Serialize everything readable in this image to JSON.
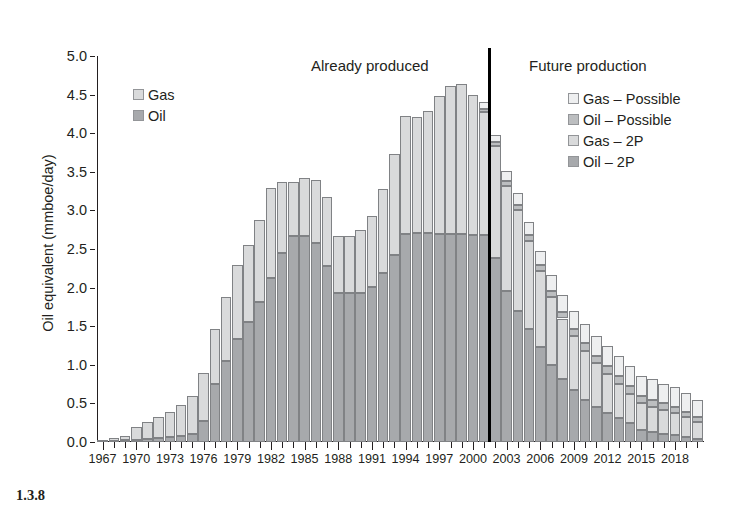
{
  "caption": "1.3.8",
  "headings": {
    "already": "Already produced",
    "future": "Future production"
  },
  "legend_left": [
    {
      "label": "Gas",
      "swatch": "gas",
      "color": "#d9dadb"
    },
    {
      "label": "Oil",
      "swatch": "oil",
      "color": "#a7a9ac"
    }
  ],
  "legend_right": [
    {
      "label": "Gas – Possible",
      "swatch": "gaspos",
      "color": "#eeeff0"
    },
    {
      "label": "Oil – Possible",
      "swatch": "oilpos",
      "color": "#bcbec0"
    },
    {
      "label": "Gas – 2P",
      "swatch": "gas2p",
      "color": "#d9dadb"
    },
    {
      "label": "Oil – 2P",
      "swatch": "oil2p",
      "color": "#a7a9ac"
    }
  ],
  "chart_data": {
    "type": "bar",
    "stacked": true,
    "title": "",
    "xlabel": "",
    "ylabel": "Oil equivalent (mmboe/day)",
    "ylim": [
      0.0,
      5.0
    ],
    "ytick_step": 0.5,
    "ytick_labels": [
      "0.0",
      "0.5",
      "1.0",
      "1.5",
      "2.0",
      "2.5",
      "3.0",
      "3.5",
      "4.0",
      "4.5",
      "5.0"
    ],
    "grid": false,
    "legend_position": "inside-top-left and inside-top-right",
    "xlim": [
      1966,
      2020
    ],
    "xtick_label_step": 3,
    "xtick_labels": [
      "1967",
      "1970",
      "1973",
      "1976",
      "1979",
      "1982",
      "1985",
      "1988",
      "1991",
      "1994",
      "1997",
      "2000",
      "2003",
      "2006",
      "2009",
      "2012",
      "2015",
      "2018"
    ],
    "divider": {
      "between": [
        2001,
        2002
      ],
      "label_left": "Already produced",
      "label_right": "Future production"
    },
    "series_names": [
      "Oil – 2P",
      "Gas – 2P",
      "Oil – Possible",
      "Gas – Possible"
    ],
    "historic_series_names": [
      "Oil",
      "Gas"
    ],
    "years": [
      1967,
      1968,
      1969,
      1970,
      1971,
      1972,
      1973,
      1974,
      1975,
      1976,
      1977,
      1978,
      1979,
      1980,
      1981,
      1982,
      1983,
      1984,
      1985,
      1986,
      1987,
      1988,
      1989,
      1990,
      1991,
      1992,
      1993,
      1994,
      1995,
      1996,
      1997,
      1998,
      1999,
      2000,
      2001,
      2002,
      2003,
      2004,
      2005,
      2006,
      2007,
      2008,
      2009,
      2010,
      2011,
      2012,
      2013,
      2014,
      2015,
      2016,
      2017,
      2018,
      2019,
      2020
    ],
    "oil_2p": [
      0.0,
      0.01,
      0.02,
      0.03,
      0.04,
      0.05,
      0.06,
      0.08,
      0.1,
      0.27,
      0.75,
      1.05,
      1.33,
      1.55,
      1.82,
      2.12,
      2.45,
      2.67,
      2.67,
      2.58,
      2.28,
      1.93,
      1.93,
      1.93,
      2.01,
      2.19,
      2.42,
      2.69,
      2.71,
      2.71,
      2.7,
      2.69,
      2.69,
      2.68,
      2.68,
      2.38,
      1.96,
      1.7,
      1.46,
      1.23,
      1.0,
      0.82,
      0.67,
      0.55,
      0.46,
      0.38,
      0.31,
      0.24,
      0.16,
      0.13,
      0.11,
      0.09,
      0.06,
      0.04
    ],
    "gas_2p": [
      0.02,
      0.04,
      0.06,
      0.16,
      0.22,
      0.28,
      0.33,
      0.4,
      0.5,
      0.63,
      0.72,
      0.83,
      0.96,
      1.0,
      1.06,
      1.17,
      0.92,
      0.7,
      0.75,
      0.82,
      0.9,
      0.74,
      0.74,
      0.81,
      0.92,
      1.09,
      1.31,
      1.53,
      1.5,
      1.58,
      1.78,
      1.92,
      1.95,
      1.82,
      1.6,
      1.45,
      1.36,
      1.3,
      1.15,
      0.98,
      0.88,
      0.78,
      0.7,
      0.63,
      0.56,
      0.5,
      0.44,
      0.38,
      0.35,
      0.33,
      0.31,
      0.29,
      0.26,
      0.22
    ],
    "oil_possible": [
      0,
      0,
      0,
      0,
      0,
      0,
      0,
      0,
      0,
      0,
      0,
      0,
      0,
      0,
      0,
      0,
      0,
      0,
      0,
      0,
      0,
      0,
      0,
      0,
      0,
      0,
      0,
      0,
      0,
      0,
      0,
      0,
      0,
      0,
      0.04,
      0.05,
      0.06,
      0.07,
      0.07,
      0.08,
      0.08,
      0.09,
      0.09,
      0.1,
      0.1,
      0.1,
      0.1,
      0.1,
      0.09,
      0.09,
      0.08,
      0.08,
      0.07,
      0.06
    ],
    "gas_possible": [
      0,
      0,
      0,
      0,
      0,
      0,
      0,
      0,
      0,
      0,
      0,
      0,
      0,
      0,
      0,
      0,
      0,
      0,
      0,
      0,
      0,
      0,
      0,
      0,
      0,
      0,
      0,
      0,
      0,
      0,
      0,
      0,
      0,
      0,
      0.08,
      0.1,
      0.13,
      0.15,
      0.17,
      0.19,
      0.21,
      0.22,
      0.24,
      0.25,
      0.25,
      0.26,
      0.26,
      0.26,
      0.26,
      0.26,
      0.25,
      0.25,
      0.24,
      0.23
    ],
    "totals": [
      0.02,
      0.05,
      0.08,
      0.19,
      0.26,
      0.33,
      0.39,
      0.48,
      0.6,
      0.9,
      1.47,
      1.88,
      2.29,
      2.55,
      2.88,
      3.29,
      3.37,
      3.37,
      3.42,
      3.4,
      3.18,
      2.67,
      2.67,
      2.74,
      2.93,
      3.28,
      3.73,
      4.22,
      4.21,
      4.29,
      4.48,
      4.61,
      4.64,
      4.5,
      4.4,
      3.98,
      3.51,
      3.22,
      2.85,
      2.48,
      2.17,
      1.91,
      1.7,
      1.53,
      1.37,
      1.24,
      1.11,
      0.98,
      0.86,
      0.81,
      0.75,
      0.71,
      0.63,
      0.55
    ]
  }
}
